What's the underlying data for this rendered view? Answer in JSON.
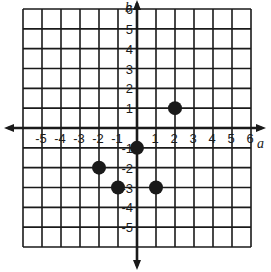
{
  "graph": {
    "x_axis_label": "a",
    "y_axis_label": "b",
    "x_range": [
      -6,
      6
    ],
    "y_range": [
      -6,
      6
    ],
    "x_ticks": [
      "-5",
      "-4",
      "-3",
      "-2",
      "-1",
      "1",
      "2",
      "3",
      "4",
      "5",
      "6"
    ],
    "y_ticks": [
      "6",
      "5",
      "4",
      "3",
      "2",
      "1",
      "-1",
      "-2",
      "-3",
      "-4",
      "-5"
    ],
    "colors": {
      "ink": "#1a1a1a",
      "background": "#ffffff"
    }
  },
  "chart_data": {
    "type": "scatter",
    "title": "",
    "xlabel": "a",
    "ylabel": "b",
    "xlim": [
      -6,
      6
    ],
    "ylim": [
      -6,
      6
    ],
    "grid": true,
    "points": [
      {
        "x": 2,
        "y": 1
      },
      {
        "x": 0,
        "y": -1
      },
      {
        "x": -2,
        "y": -2
      },
      {
        "x": -1,
        "y": -3
      },
      {
        "x": 1,
        "y": -3
      }
    ]
  }
}
